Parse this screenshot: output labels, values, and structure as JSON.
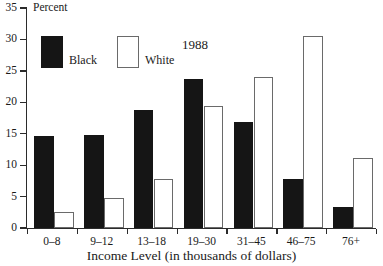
{
  "chart_data": {
    "type": "bar",
    "title": "",
    "annotation": "1988",
    "xlabel": "Income Level (in thousands of dollars)",
    "ylabel": "Percent",
    "categories": [
      "0–8",
      "9–12",
      "13–18",
      "19–30",
      "31–45",
      "46–75",
      "76+"
    ],
    "series": [
      {
        "name": "Black",
        "color": "#151515",
        "values": [
          14.6,
          14.8,
          18.7,
          23.7,
          16.8,
          7.8,
          3.3
        ]
      },
      {
        "name": "White",
        "color": "#ffffff",
        "values": [
          2.5,
          4.7,
          7.8,
          19.4,
          24.0,
          30.5,
          11.2
        ]
      }
    ],
    "ylim": [
      0,
      35
    ],
    "yticks": [
      0,
      5,
      10,
      15,
      20,
      25,
      30,
      35
    ],
    "ytick_labels": [
      "0",
      "5",
      "10",
      "15",
      "20",
      "25",
      "30",
      "35"
    ],
    "grid": false,
    "legend_position": "top-left",
    "legend": [
      "Black",
      "White"
    ]
  }
}
